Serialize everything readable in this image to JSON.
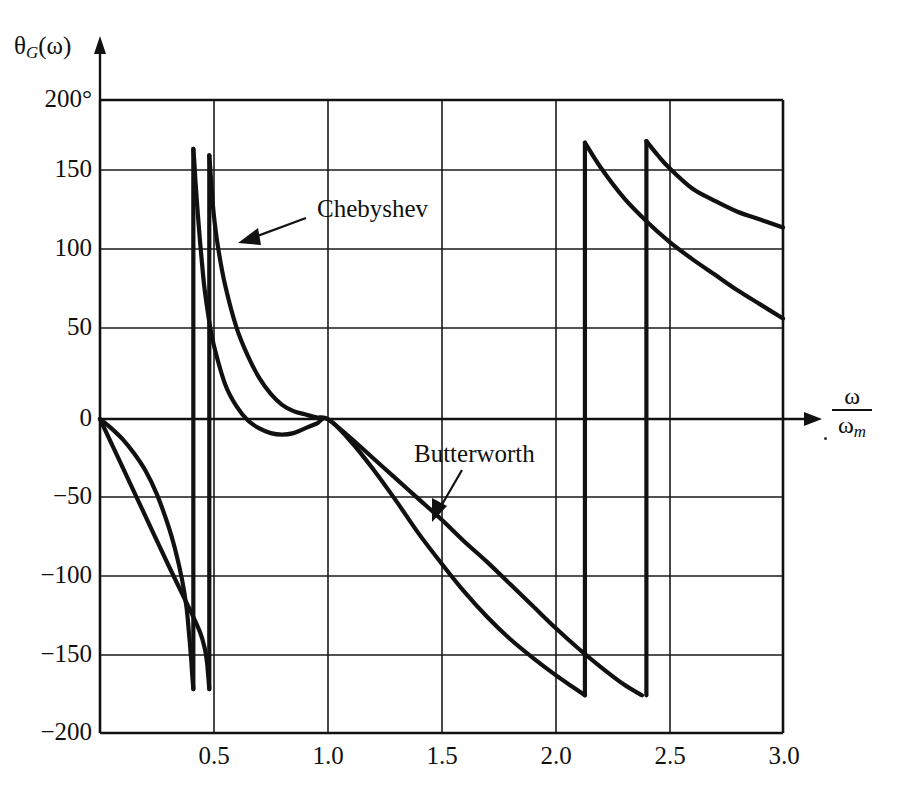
{
  "figure": {
    "y_axis_title": "θ",
    "y_axis_title_sub": "G",
    "y_axis_title_arg": "(ω)",
    "x_axis_title_num": "ω",
    "x_axis_title_den": "ω",
    "x_axis_title_den_sub": "m"
  },
  "annotations": [
    {
      "label": "Chebyshev"
    },
    {
      "label": "Butterworth"
    }
  ],
  "y_ticks": [
    {
      "label": "200°",
      "value": 200
    },
    {
      "label": "150",
      "value": 150
    },
    {
      "label": "100",
      "value": 100
    },
    {
      "label": "50",
      "value": 50
    },
    {
      "label": "0",
      "value": 0
    },
    {
      "label": "−50",
      "value": -50
    },
    {
      "label": "−100",
      "value": -100
    },
    {
      "label": "−150",
      "value": -150
    },
    {
      "label": "−200",
      "value": -200
    }
  ],
  "x_ticks": [
    {
      "label": "0.5",
      "value": 0.5
    },
    {
      "label": "1.0",
      "value": 1.0
    },
    {
      "label": "1.5",
      "value": 1.5
    },
    {
      "label": "2.0",
      "value": 2.0
    },
    {
      "label": "2.5",
      "value": 2.5
    },
    {
      "label": "3.0",
      "value": 3.0
    }
  ],
  "chart_data": {
    "type": "line",
    "title": "",
    "xlabel": "ω/ωm",
    "ylabel": "θG(ω)",
    "xlim": [
      0,
      3.0
    ],
    "ylim": [
      -200,
      200
    ],
    "grid": true,
    "legend": "annotated-inline",
    "xticks": [
      0.5,
      1.0,
      1.5,
      2.0,
      2.5,
      3.0
    ],
    "yticks": [
      -200,
      -150,
      -100,
      -50,
      0,
      50,
      100,
      150,
      200
    ],
    "series": [
      {
        "name": "Chebyshev",
        "color": "#111111",
        "segments": [
          [
            [
              0.0,
              0
            ],
            [
              0.05,
              -6
            ],
            [
              0.1,
              -13
            ],
            [
              0.15,
              -22
            ],
            [
              0.2,
              -33
            ],
            [
              0.25,
              -48
            ],
            [
              0.3,
              -68
            ],
            [
              0.33,
              -83
            ],
            [
              0.36,
              -102
            ],
            [
              0.38,
              -120
            ],
            [
              0.39,
              -135
            ],
            [
              0.4,
              -152
            ],
            [
              0.405,
              -163
            ],
            [
              0.41,
              -172
            ]
          ],
          [
            [
              0.41,
              172
            ],
            [
              0.415,
              162
            ],
            [
              0.42,
              150
            ],
            [
              0.43,
              130
            ],
            [
              0.44,
              112
            ],
            [
              0.45,
              96
            ],
            [
              0.46,
              82
            ],
            [
              0.48,
              62
            ],
            [
              0.5,
              47
            ],
            [
              0.55,
              22
            ],
            [
              0.6,
              8
            ],
            [
              0.65,
              -1
            ],
            [
              0.7,
              -6
            ],
            [
              0.75,
              -9
            ],
            [
              0.8,
              -10
            ],
            [
              0.85,
              -9
            ],
            [
              0.9,
              -6
            ],
            [
              0.95,
              -3
            ],
            [
              1.0,
              0
            ],
            [
              1.1,
              -14
            ],
            [
              1.2,
              -32
            ],
            [
              1.3,
              -52
            ],
            [
              1.4,
              -73
            ],
            [
              1.5,
              -92
            ],
            [
              1.6,
              -110
            ],
            [
              1.7,
              -126
            ],
            [
              1.8,
              -140
            ],
            [
              1.9,
              -152
            ],
            [
              2.0,
              -163
            ],
            [
              2.08,
              -171
            ],
            [
              2.13,
              -176
            ]
          ],
          [
            [
              2.13,
              176
            ],
            [
              2.2,
              160
            ],
            [
              2.3,
              141
            ],
            [
              2.4,
              126
            ],
            [
              2.5,
              113
            ],
            [
              2.6,
              102
            ],
            [
              2.7,
              92
            ],
            [
              2.8,
              82
            ],
            [
              2.9,
              73
            ],
            [
              3.0,
              64
            ]
          ]
        ]
      },
      {
        "name": "Butterworth",
        "color": "#111111",
        "segments": [
          [
            [
              0.0,
              0
            ],
            [
              0.1,
              -31
            ],
            [
              0.2,
              -62
            ],
            [
              0.3,
              -93
            ],
            [
              0.4,
              -123
            ],
            [
              0.44,
              -136
            ],
            [
              0.46,
              -146
            ],
            [
              0.47,
              -155
            ],
            [
              0.475,
              -163
            ],
            [
              0.48,
              -172
            ]
          ],
          [
            [
              0.48,
              168
            ],
            [
              0.485,
              158
            ],
            [
              0.49,
              148
            ],
            [
              0.5,
              130
            ],
            [
              0.52,
              108
            ],
            [
              0.55,
              85
            ],
            [
              0.6,
              58
            ],
            [
              0.65,
              40
            ],
            [
              0.7,
              26
            ],
            [
              0.75,
              16
            ],
            [
              0.8,
              9
            ],
            [
              0.85,
              5
            ],
            [
              0.9,
              3
            ],
            [
              0.95,
              1
            ],
            [
              1.0,
              0
            ],
            [
              1.1,
              -12
            ],
            [
              1.2,
              -25
            ],
            [
              1.3,
              -38
            ],
            [
              1.4,
              -51
            ],
            [
              1.5,
              -64
            ],
            [
              1.6,
              -78
            ],
            [
              1.7,
              -91
            ],
            [
              1.8,
              -105
            ],
            [
              1.9,
              -119
            ],
            [
              2.0,
              -133
            ],
            [
              2.1,
              -146
            ],
            [
              2.2,
              -158
            ],
            [
              2.3,
              -169
            ],
            [
              2.38,
              -176
            ]
          ],
          [
            [
              2.4,
              177
            ],
            [
              2.45,
              168
            ],
            [
              2.5,
              160
            ],
            [
              2.6,
              147
            ],
            [
              2.7,
              139
            ],
            [
              2.8,
              132
            ],
            [
              2.9,
              127
            ],
            [
              3.0,
              122
            ]
          ]
        ]
      }
    ],
    "discontinuities": [
      {
        "series": "Chebyshev",
        "x": 0.41,
        "from": -172,
        "to": 172
      },
      {
        "series": "Butterworth",
        "x": 0.48,
        "from": -172,
        "to": 168
      },
      {
        "series": "Chebyshev",
        "x": 2.13,
        "from": -176,
        "to": 176
      },
      {
        "series": "Butterworth",
        "x": 2.4,
        "from": -176,
        "to": 177
      }
    ]
  }
}
